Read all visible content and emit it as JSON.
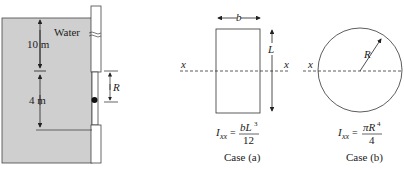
{
  "figure": {
    "tank": {
      "fluid_label": "Water",
      "upper_depth_label": "10 m",
      "gate_height_label": "4 m",
      "hinge_offset_label": "R",
      "fluid_color": "#cfcfcf"
    },
    "case_a": {
      "width_label": "b",
      "length_label": "L",
      "axis_label_left": "x",
      "axis_label_right": "x",
      "formula_lhs": "I",
      "formula_sub": "xx",
      "formula_eq": "=",
      "formula_num": "bL",
      "formula_num_exp": "3",
      "formula_den": "12",
      "caption": "Case (a)"
    },
    "case_b": {
      "radius_label": "R",
      "axis_label_left": "x",
      "formula_lhs": "I",
      "formula_sub": "xx",
      "formula_eq": "=",
      "formula_num": "πR",
      "formula_num_exp": "4",
      "formula_den": "4",
      "caption": "Case (b)"
    }
  }
}
